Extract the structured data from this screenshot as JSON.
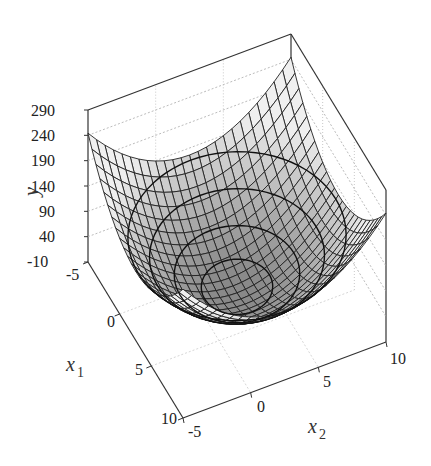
{
  "chart_data": {
    "type": "surface3d",
    "title": "",
    "function": "bowl-shaped quadratic surface y(x1,x2) with contour lines on surface",
    "x1": {
      "label": "x1",
      "ticks": [
        -5,
        0,
        5,
        10
      ],
      "range": [
        -5,
        10
      ]
    },
    "x2": {
      "label": "x2",
      "ticks": [
        -5,
        0,
        5,
        10
      ],
      "range": [
        -5,
        10
      ]
    },
    "y": {
      "label": "y",
      "ticks": [
        -10,
        40,
        90,
        140,
        190,
        240,
        290
      ],
      "range": [
        -10,
        290
      ]
    },
    "minimum": {
      "x1": 2.5,
      "x2": 2.5,
      "y": 0
    },
    "corner_values": {
      "x1=-5,x2=-5": 140,
      "x1=-5,x2=10": 160,
      "x1=10,x2=10": 110,
      "x1=10,x2=-5": 110
    },
    "grid": true,
    "colormap": "grayscale",
    "mesh": "black wireframe"
  },
  "labels": {
    "y": "y",
    "x1": "x",
    "x1_sub": "1",
    "x2": "x",
    "x2_sub": "2",
    "y_ticks": [
      "290",
      "240",
      "190",
      "140",
      "90",
      "40",
      "-10"
    ],
    "x1_ticks": [
      "-5",
      "0",
      "5",
      "10"
    ],
    "x2_ticks": [
      "-5",
      "0",
      "5",
      "10"
    ]
  }
}
